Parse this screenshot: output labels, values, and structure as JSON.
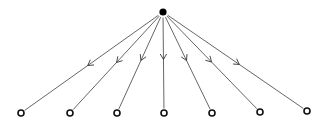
{
  "diagram": {
    "type": "tree",
    "colors": {
      "background": "#ffffff",
      "edge": "#555555",
      "source": "#000000",
      "leaf_stroke": "#111111"
    },
    "source": {
      "id": "root",
      "x": 163,
      "y": 12,
      "r": 3.6,
      "style": "filled"
    },
    "leaves": [
      {
        "id": "leaf-1",
        "x": 21,
        "y": 113,
        "r": 3,
        "style": "hollow"
      },
      {
        "id": "leaf-2",
        "x": 70,
        "y": 113,
        "r": 3,
        "style": "hollow"
      },
      {
        "id": "leaf-3",
        "x": 117,
        "y": 113,
        "r": 3,
        "style": "hollow"
      },
      {
        "id": "leaf-4",
        "x": 164,
        "y": 113,
        "r": 3,
        "style": "hollow"
      },
      {
        "id": "leaf-5",
        "x": 212,
        "y": 113,
        "r": 3,
        "style": "hollow"
      },
      {
        "id": "leaf-6",
        "x": 260,
        "y": 112,
        "r": 3,
        "style": "hollow"
      },
      {
        "id": "leaf-7",
        "x": 307,
        "y": 111,
        "r": 3,
        "style": "hollow"
      }
    ],
    "edges": [
      {
        "from": "root",
        "to": "leaf-1",
        "arrow_at": 0.53
      },
      {
        "from": "root",
        "to": "leaf-2",
        "arrow_at": 0.5
      },
      {
        "from": "root",
        "to": "leaf-3",
        "arrow_at": 0.48
      },
      {
        "from": "root",
        "to": "leaf-4",
        "arrow_at": 0.47
      },
      {
        "from": "root",
        "to": "leaf-5",
        "arrow_at": 0.48
      },
      {
        "from": "root",
        "to": "leaf-6",
        "arrow_at": 0.5
      },
      {
        "from": "root",
        "to": "leaf-7",
        "arrow_at": 0.53
      }
    ]
  }
}
